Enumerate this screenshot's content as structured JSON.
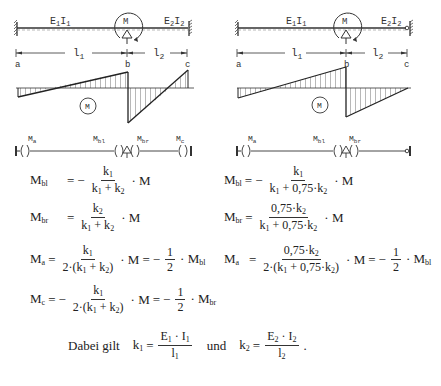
{
  "left_system": {
    "beam_label_1": "E",
    "beam_label_1_full": "E1I1",
    "beam_label_2_full": "E2I2",
    "moment_label": "M",
    "span_1": "l1",
    "span_2": "l2",
    "points": [
      "a",
      "b",
      "c"
    ],
    "diagram_label": "M",
    "moment_labels": [
      "Ma",
      "Mbl",
      "Mbr",
      "Mc"
    ],
    "right_support": "fixed"
  },
  "right_system": {
    "beam_label_1_full": "E1I1",
    "beam_label_2_full": "E2I2",
    "moment_label": "M",
    "span_1": "l1",
    "span_2": "l2",
    "points": [
      "a",
      "b",
      "c"
    ],
    "diagram_label": "M",
    "moment_labels": [
      "Ma",
      "Mbl",
      "Mbr"
    ],
    "right_support": "pinned"
  },
  "formulas_left": {
    "Mbl": {
      "lhs": "M",
      "lhs_sub": "bl",
      "sign": "−",
      "num": "k1",
      "den": "k1 + k2",
      "tail": "· M"
    },
    "Mbr": {
      "lhs": "M",
      "lhs_sub": "br",
      "sign": "",
      "num": "k2",
      "den": "k1 + k2",
      "tail": "· M"
    },
    "Ma": {
      "lhs": "M",
      "lhs_sub": "a",
      "sign": "",
      "num": "k1",
      "den": "2·(k1 + k2)",
      "tail": "· M = −½ · Mbl"
    },
    "Mc": {
      "lhs": "M",
      "lhs_sub": "c",
      "sign": "−",
      "num": "k1",
      "den": "2·(k1 + k2)",
      "tail": "· M = −½ · Mbr"
    }
  },
  "formulas_right": {
    "Mbl": {
      "lhs": "M",
      "lhs_sub": "bl",
      "sign": "−",
      "num": "k1",
      "den": "k1 + 0,75·k2",
      "tail": "· M"
    },
    "Mbr": {
      "lhs": "M",
      "lhs_sub": "br",
      "sign": "",
      "num": "0,75·k2",
      "den": "k1 + 0,75·k2",
      "tail": "· M"
    },
    "Ma": {
      "lhs": "M",
      "lhs_sub": "a",
      "sign": "",
      "num": "0,75·k2",
      "den": "2·(k1 + 0,75·k2)",
      "tail": "· M = −½ · Mbl"
    }
  },
  "footer": {
    "intro": "Dabei gilt",
    "k1_num": "E1 · I1",
    "k1_den": "l1",
    "and": "und",
    "k2_num": "E2 · I2",
    "k2_den": "l2"
  },
  "text": {
    "eq": "=",
    "minus": "−",
    "dot_M": "· M",
    "M": "M",
    "one": "1",
    "two": "2",
    "k": "k",
    "E": "E",
    "I": "I",
    "l": "l",
    "period": "."
  }
}
